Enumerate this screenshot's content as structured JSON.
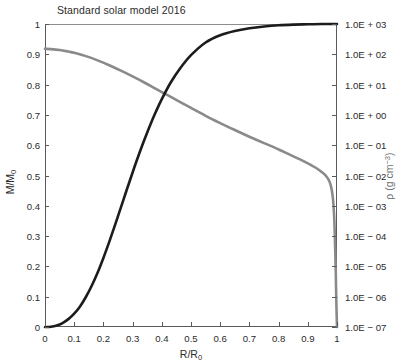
{
  "chart_data": {
    "type": "line",
    "title": "Standard solar model 2016",
    "xlabel": "R/R₀",
    "xlim": [
      0,
      1
    ],
    "xticks": [
      "0",
      "0.1",
      "0.2",
      "0.3",
      "0.4",
      "0.5",
      "0.6",
      "0.7",
      "0.8",
      "0.9",
      "1"
    ],
    "xtick_values": [
      0,
      0.1,
      0.2,
      0.3,
      0.4,
      0.5,
      0.6,
      0.7,
      0.8,
      0.9,
      1
    ],
    "grid": false,
    "legend": "none",
    "axes": [
      {
        "id": "left",
        "label": "M/M₀",
        "scale": "linear",
        "lim": [
          0,
          1
        ],
        "ticks": [
          "0",
          "0.1",
          "0.2",
          "0.3",
          "0.4",
          "0.5",
          "0.6",
          "0.7",
          "0.8",
          "0.9",
          "1"
        ],
        "tick_values": [
          0,
          0.1,
          0.2,
          0.3,
          0.4,
          0.5,
          0.6,
          0.7,
          0.8,
          0.9,
          1
        ]
      },
      {
        "id": "right",
        "label": "ρ (g cm⁻³)",
        "scale": "log10",
        "lim": [
          1e-07,
          1000
        ],
        "ticks": [
          "1.0E − 07",
          "1.0E − 06",
          "1.0E − 05",
          "1.0E − 04",
          "1.0E − 03",
          "1.0E − 02",
          "1.0E − 01",
          "1.0E + 00",
          "1.0E + 01",
          "1.0E + 02",
          "1.0E + 03"
        ],
        "tick_exponents": [
          -7,
          -6,
          -5,
          -4,
          -3,
          -2,
          -1,
          0,
          1,
          2,
          3
        ]
      }
    ],
    "series": [
      {
        "name": "Enclosed mass fraction",
        "axis": "left",
        "color": "#1c1c1c",
        "width": 2.6,
        "x": [
          0,
          0.02,
          0.04,
          0.06,
          0.08,
          0.1,
          0.12,
          0.14,
          0.16,
          0.18,
          0.2,
          0.22,
          0.24,
          0.26,
          0.28,
          0.3,
          0.32,
          0.34,
          0.36,
          0.38,
          0.4,
          0.43,
          0.46,
          0.5,
          0.55,
          0.6,
          0.65,
          0.7,
          0.75,
          0.8,
          0.85,
          0.9,
          0.95,
          1
        ],
        "y": [
          0,
          0.001,
          0.005,
          0.013,
          0.026,
          0.044,
          0.068,
          0.099,
          0.136,
          0.179,
          0.228,
          0.281,
          0.337,
          0.395,
          0.453,
          0.51,
          0.565,
          0.617,
          0.666,
          0.711,
          0.752,
          0.806,
          0.85,
          0.897,
          0.939,
          0.963,
          0.977,
          0.986,
          0.992,
          0.996,
          0.998,
          0.999,
          1.0,
          1.0
        ]
      },
      {
        "name": "Density",
        "axis": "right",
        "color": "#8a8a8a",
        "width": 2.6,
        "x": [
          0,
          0.02,
          0.05,
          0.08,
          0.1,
          0.14,
          0.18,
          0.22,
          0.26,
          0.3,
          0.34,
          0.38,
          0.42,
          0.46,
          0.5,
          0.55,
          0.6,
          0.65,
          0.7,
          0.75,
          0.8,
          0.84,
          0.88,
          0.91,
          0.93,
          0.95,
          0.96,
          0.97,
          0.975,
          0.98,
          0.984,
          0.987,
          0.99,
          0.992,
          0.994,
          0.996,
          0.998,
          1
        ],
        "rho_log10": [
          2.18,
          2.17,
          2.14,
          2.09,
          2.05,
          1.94,
          1.8,
          1.64,
          1.46,
          1.27,
          1.07,
          0.86,
          0.65,
          0.44,
          0.23,
          -0.03,
          -0.27,
          -0.5,
          -0.72,
          -0.93,
          -1.14,
          -1.32,
          -1.5,
          -1.65,
          -1.76,
          -1.9,
          -1.99,
          -2.12,
          -2.22,
          -2.38,
          -2.6,
          -2.85,
          -3.3,
          -3.8,
          -4.5,
          -5.3,
          -6.3,
          -7.0
        ]
      }
    ],
    "annotations": {
      "curve_crossing": {
        "x": 0.38,
        "m_over_m0": 0.77,
        "rho_log10": 0.86
      }
    }
  }
}
